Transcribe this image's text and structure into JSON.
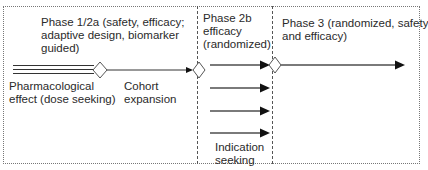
{
  "diagram": {
    "phases": [
      {
        "id": "phase-1-2a",
        "title_lines": [
          "Phase 1/2a (safety, efficacy;",
          "adaptive design, biomarker",
          "guided)"
        ]
      },
      {
        "id": "phase-2b",
        "title_lines": [
          "Phase 2b",
          "efficacy",
          "(randomized)"
        ]
      },
      {
        "id": "phase-3",
        "title_lines": [
          "Phase 3 (randomized, safety",
          "and efficacy)"
        ]
      }
    ],
    "annotations": {
      "pharmacological": [
        "Pharmacological",
        "effect (dose seeking)"
      ],
      "cohort": [
        "Cohort",
        "expansion"
      ],
      "indication": [
        "Indication",
        "seeking"
      ]
    },
    "colors": {
      "line": "#333333",
      "arrow_gray": "#808080",
      "border": "#777777"
    }
  }
}
